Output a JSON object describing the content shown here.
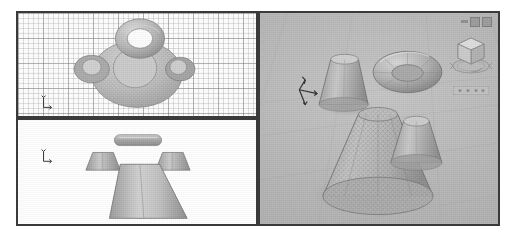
{
  "app": {
    "title": "CAD Modeling Workspace",
    "background_color": "#ffffff",
    "frame_color": "#3a3a3a"
  },
  "window_controls": [
    {
      "name": "minimize-button",
      "glyph": "dash"
    },
    {
      "name": "restore-button",
      "glyph": "square"
    },
    {
      "name": "close-button",
      "glyph": "square"
    }
  ],
  "viewports": [
    {
      "id": "vp-top",
      "name": "top-view-viewport",
      "label": "Top",
      "projection": "orthographic",
      "background_color": "#ffffff",
      "grid": true,
      "grid_color": "#969696",
      "ucs_axes": [
        "X",
        "Y"
      ],
      "objects": [
        {
          "name": "torus",
          "shape": "torus",
          "shading": "shaded"
        },
        {
          "name": "large-cone",
          "shape": "cone",
          "shading": "mesh"
        },
        {
          "name": "small-cone-left",
          "shape": "cone",
          "shading": "shaded"
        },
        {
          "name": "small-cone-right",
          "shape": "cone",
          "shading": "shaded"
        }
      ]
    },
    {
      "id": "vp-front",
      "name": "front-view-viewport",
      "label": "Front",
      "projection": "orthographic",
      "background_color": "#ffffff",
      "grid": false,
      "ucs_axes": [
        "X",
        "Z"
      ],
      "objects": [
        {
          "name": "torus",
          "shape": "torus",
          "shading": "shaded"
        },
        {
          "name": "small-cone-left",
          "shape": "frustum",
          "shading": "shaded"
        },
        {
          "name": "small-cone-right",
          "shape": "frustum",
          "shading": "shaded"
        },
        {
          "name": "large-cone",
          "shape": "frustum",
          "shading": "shaded"
        }
      ]
    },
    {
      "id": "vp-3d",
      "name": "perspective-3d-viewport",
      "label": "3D Perspective",
      "projection": "perspective",
      "background_color": "#b2b2b2",
      "ground_plane": true,
      "ucs_axes": [
        "X",
        "Y",
        "Z"
      ],
      "objects": [
        {
          "name": "torus",
          "shape": "torus",
          "shading": "shaded"
        },
        {
          "name": "small-cone-back",
          "shape": "cone",
          "shading": "shaded"
        },
        {
          "name": "small-cone-right",
          "shape": "cone",
          "shading": "shaded"
        },
        {
          "name": "large-cone",
          "shape": "cone",
          "shading": "mesh"
        }
      ],
      "widgets": [
        {
          "name": "view-cube",
          "label": "ViewCube"
        },
        {
          "name": "navigation-bar",
          "label": "Navigation Bar"
        }
      ]
    }
  ],
  "colors": {
    "viewport_bg_2d": "#ffffff",
    "viewport_bg_3d": "#b2b2b2",
    "object_fill": "#b8b8b8",
    "object_fill_dark": "#8f8f8f",
    "object_fill_light": "#d2d2d2",
    "edge": "#6e6e6e",
    "grid_minor": "#c8c8c8",
    "grid_major": "#a0a0a0",
    "ucs_axis": "#2e2e2e"
  }
}
